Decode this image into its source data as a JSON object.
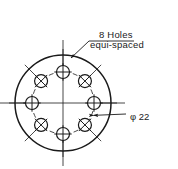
{
  "drawing": {
    "title": "bolt-circle-detail",
    "background_color": "#ffffff",
    "line_color": "#1a1a1a",
    "notes": {
      "holes_line1": "8 Holes",
      "holes_line2": "equi-spaced"
    },
    "dimensions": {
      "bolt_circle_diameter_label": "φ 22",
      "bolt_circle_diameter_symbol": "φ",
      "bolt_circle_diameter_value": "22"
    },
    "geometry": {
      "center": {
        "x": 63,
        "y": 103
      },
      "outer_circle_radius": 48,
      "bolt_circle_radius": 31,
      "hole_radius": 6.5,
      "hole_count": 8,
      "hole_start_angle_deg": -90,
      "hole_step_deg": 45,
      "hole_marks": [
        "plus",
        "cross",
        "plus",
        "cross",
        "plus",
        "cross",
        "plus",
        "cross"
      ],
      "centerline_h_extent": {
        "x1": 0,
        "x2": 125
      },
      "centerline_v_extent": {
        "y1": 40,
        "y2": 166
      },
      "radial_tick_inner_r": 36,
      "radial_tick_outer_r": 54,
      "dim_line_angle_deg": 22,
      "dim_line_start_r": -33,
      "dim_line_end_r": 33,
      "dim_leader_end": {
        "x": 126,
        "y": 114
      }
    },
    "leader": {
      "text_anchor": {
        "x": 97,
        "y": 41
      },
      "elbow": {
        "x": 89,
        "y": 41
      },
      "arrow_tip": {
        "x": 71,
        "y": 58
      },
      "underline": {
        "x1": 89,
        "x2": 134,
        "y": 41
      }
    },
    "text_positions": {
      "holes_line1": {
        "x": 99,
        "y": 38
      },
      "holes_line2": {
        "x": 90,
        "y": 48
      },
      "diameter": {
        "x": 130,
        "y": 120
      }
    }
  }
}
